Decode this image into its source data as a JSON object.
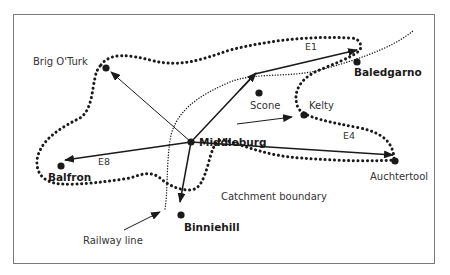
{
  "diagram": {
    "type": "catchment area map",
    "towns": [
      {
        "name": "Middleburg",
        "bold": true,
        "x": 191,
        "y": 142
      },
      {
        "name": "Brig O'Turk",
        "bold": false,
        "x": 106,
        "y": 68
      },
      {
        "name": "Baledgarno",
        "bold": true,
        "x": 385,
        "y": 62
      },
      {
        "name": "Scone",
        "bold": false,
        "x": 259,
        "y": 93
      },
      {
        "name": "Kelty",
        "bold": false,
        "x": 304,
        "y": 115
      },
      {
        "name": "Auchtertool",
        "bold": false,
        "x": 395,
        "y": 161
      },
      {
        "name": "Balfron",
        "bold": true,
        "x": 35,
        "y": 166
      },
      {
        "name": "Binniehill",
        "bold": true,
        "x": 181,
        "y": 214
      }
    ],
    "routes": [
      {
        "label": "E1",
        "from": "Middleburg",
        "to": "Baledgarno"
      },
      {
        "label": "E4",
        "from": "Middleburg",
        "to": "Auchtertool"
      },
      {
        "label": "E8",
        "from": "Middleburg",
        "to": "Balfron"
      }
    ],
    "annotations": {
      "catchment": "Catchment boundary",
      "railway": "Railway line"
    },
    "labels": {
      "middleburg": "Middleburg",
      "brig": "Brig O'Turk",
      "baledgarno": "Baledgarno",
      "scone": "Scone",
      "kelty": "Kelty",
      "auchtertool": "Auchtertool",
      "balfron": "Balfron",
      "binniehill": "Binniehill",
      "e1": "E1",
      "e4": "E4",
      "e8": "E8"
    },
    "colors": {
      "ink": "#1a1a1a",
      "frame": "#7a7a7a",
      "background": "#ffffff"
    }
  }
}
